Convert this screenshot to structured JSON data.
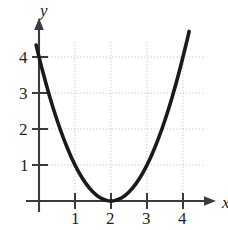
{
  "figure": {
    "background_color": "#ffffff",
    "width": 228,
    "height": 230
  },
  "chart_data": {
    "type": "line",
    "title": "",
    "subtitle": "",
    "xlabel": "x",
    "ylabel": "y",
    "equation": "y = (x - 2)^2",
    "curve_color": "#1a1a1a",
    "axis_color": "#3b3b3b",
    "grid_color": "#b9b9b9",
    "grid": true,
    "grid_style": "dotted",
    "legend": "none",
    "xlim": [
      -0.15,
      4.9
    ],
    "ylim": [
      -0.45,
      4.75
    ],
    "xticks": [
      1,
      2,
      3,
      4
    ],
    "yticks": [
      1,
      2,
      3,
      4
    ],
    "xtick_labels": [
      "1",
      "2",
      "3",
      "4"
    ],
    "ytick_labels": [
      "1",
      "2",
      "3",
      "4"
    ],
    "vertex": [
      2,
      0
    ],
    "x_domain_drawn": [
      -0.08,
      4.17
    ],
    "x": [
      -0.08,
      0.1,
      0.3,
      0.5,
      0.7,
      0.9,
      1.1,
      1.3,
      1.5,
      1.7,
      1.9,
      2.0,
      2.1,
      2.3,
      2.5,
      2.7,
      2.9,
      3.1,
      3.3,
      3.5,
      3.7,
      3.9,
      4.1,
      4.17
    ],
    "y": [
      4.33,
      3.61,
      2.89,
      2.25,
      1.69,
      1.21,
      0.81,
      0.49,
      0.25,
      0.09,
      0.01,
      0.0,
      0.01,
      0.09,
      0.25,
      0.49,
      0.81,
      1.21,
      1.69,
      2.25,
      2.89,
      3.61,
      4.41,
      4.71
    ],
    "annotations": []
  },
  "axes": {
    "y_axis_label": "y",
    "x_axis_label": "x",
    "y_arrow": "up-arrow-head",
    "x_arrow": "right-arrow-head"
  },
  "tick_labels": {
    "y": [
      {
        "value": "4"
      },
      {
        "value": "3"
      },
      {
        "value": "2"
      },
      {
        "value": "1"
      }
    ],
    "x": [
      {
        "value": "1"
      },
      {
        "value": "2"
      },
      {
        "value": "3"
      },
      {
        "value": "4"
      }
    ]
  }
}
